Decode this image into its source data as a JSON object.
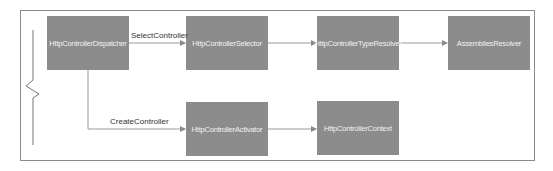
{
  "diagram": {
    "nodes": [
      {
        "id": "dispatcher",
        "label": "HttpControllerDispatcher"
      },
      {
        "id": "selector",
        "label": "HttpControllerSelector"
      },
      {
        "id": "type_resolver",
        "label": "HttpControllerTypeResolver"
      },
      {
        "id": "assemblies_resolver",
        "label": "AssembliesResolver"
      },
      {
        "id": "activator",
        "label": "HttpControllerActivator"
      },
      {
        "id": "context",
        "label": "HttpControllerContext"
      }
    ],
    "edges": [
      {
        "from": "dispatcher",
        "to": "selector",
        "label": "SelectController"
      },
      {
        "from": "selector",
        "to": "type_resolver",
        "label": ""
      },
      {
        "from": "type_resolver",
        "to": "assemblies_resolver",
        "label": ""
      },
      {
        "from": "dispatcher",
        "to": "activator",
        "label": "CreateController"
      },
      {
        "from": "activator",
        "to": "context",
        "label": ""
      }
    ],
    "colors": {
      "node_fill": "#8c8c8c",
      "node_text": "#f2f2f2",
      "line": "#9a9a9a",
      "frame": "#8a8a8a"
    }
  }
}
